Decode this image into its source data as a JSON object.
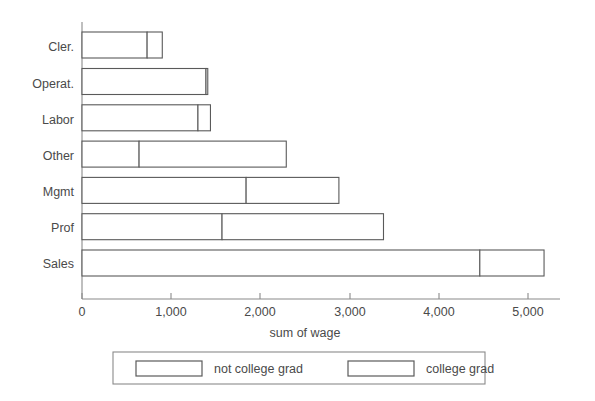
{
  "chart_data": {
    "type": "bar",
    "orientation": "horizontal",
    "stacked": true,
    "title": "",
    "xlabel": "sum of wage",
    "ylabel": "",
    "xlim": [
      0,
      5400
    ],
    "grid": false,
    "legend_position": "bottom",
    "categories": [
      "Cler.",
      "Operat.",
      "Labor",
      "Other",
      "Mgmt",
      "Prof",
      "Sales"
    ],
    "xticks": [
      0,
      1000,
      2000,
      3000,
      4000,
      5000
    ],
    "xtick_labels": [
      "0",
      "1,000",
      "2,000",
      "3,000",
      "4,000",
      "5,000"
    ],
    "series": [
      {
        "name": "not college grad",
        "values": [
          730,
          1390,
          1300,
          640,
          1840,
          1570,
          4460
        ]
      },
      {
        "name": "college grad",
        "values": [
          170,
          20,
          140,
          1650,
          1040,
          1810,
          720
        ]
      }
    ],
    "totals": [
      900,
      1410,
      1440,
      2290,
      2880,
      3380,
      5180
    ],
    "colors": {
      "bar_fill": "#ffffff",
      "bar_stroke": "#5a5a5a",
      "axis": "#8a8a8a",
      "text": "#4a4a4a",
      "background": "#ffffff"
    }
  },
  "legend": {
    "items": [
      {
        "label": "not college grad"
      },
      {
        "label": "college grad"
      }
    ]
  },
  "axis": {
    "x_title": "sum of wage"
  }
}
